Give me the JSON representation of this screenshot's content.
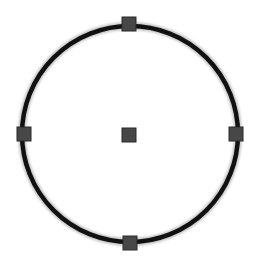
{
  "canvas": {
    "width": 255,
    "height": 260,
    "background": "#ffffff"
  },
  "shape": {
    "type": "circle",
    "center": {
      "x": 130,
      "y": 134
    },
    "radius": 108,
    "stroke_color": "#111111",
    "stroke_width": 4.5,
    "fill": "none"
  },
  "handles": {
    "size": 14,
    "fill_color": "#474747",
    "stroke_color": "#2a2a2a",
    "items": [
      {
        "name": "top-handle",
        "x": 129,
        "y": 24
      },
      {
        "name": "left-handle",
        "x": 24,
        "y": 134
      },
      {
        "name": "right-handle",
        "x": 236,
        "y": 134
      },
      {
        "name": "bottom-handle",
        "x": 130,
        "y": 243
      },
      {
        "name": "center-handle",
        "x": 129,
        "y": 135
      }
    ]
  }
}
